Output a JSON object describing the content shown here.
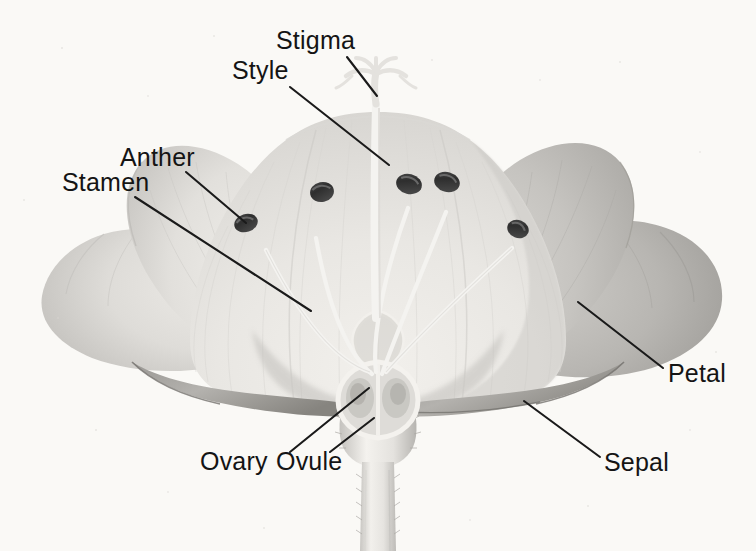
{
  "figure": {
    "background_color": "#faf9f6",
    "line_color": "#1a1a1a",
    "text_color": "#141414"
  },
  "labels": [
    {
      "id": "stigma",
      "text": "Stigma",
      "text_x": 276,
      "text_y": 49,
      "leader": {
        "x1": 347,
        "y1": 57,
        "x2": 377,
        "y2": 96
      },
      "target": "stigma-crown"
    },
    {
      "id": "style",
      "text": "Style",
      "text_x": 232,
      "text_y": 79,
      "leader": {
        "x1": 290,
        "y1": 87,
        "x2": 389,
        "y2": 165
      },
      "target": "style-column"
    },
    {
      "id": "anther",
      "text": "Anther",
      "text_x": 120,
      "text_y": 166,
      "leader": {
        "x1": 186,
        "y1": 172,
        "x2": 246,
        "y2": 223
      },
      "target": "anther-left"
    },
    {
      "id": "stamen",
      "text": "Stamen",
      "text_x": 62,
      "text_y": 191,
      "leader": {
        "x1": 135,
        "y1": 197,
        "x2": 311,
        "y2": 311
      },
      "target": "stamen-filament"
    },
    {
      "id": "petal",
      "text": "Petal",
      "text_x": 668,
      "text_y": 382,
      "leader": {
        "x1": 663,
        "y1": 368,
        "x2": 578,
        "y2": 302
      },
      "target": "petal-right"
    },
    {
      "id": "sepal",
      "text": "Sepal",
      "text_x": 604,
      "text_y": 471,
      "leader": {
        "x1": 600,
        "y1": 457,
        "x2": 524,
        "y2": 401
      },
      "target": "sepal-right"
    },
    {
      "id": "ovary",
      "text": "Ovary",
      "text_x": 200,
      "text_y": 470,
      "leader": {
        "x1": 290,
        "y1": 452,
        "x2": 369,
        "y2": 388
      },
      "target": "ovary-chamber"
    },
    {
      "id": "ovule",
      "text": "Ovule",
      "text_x": 276,
      "text_y": 470,
      "leader": {
        "x1": 330,
        "y1": 452,
        "x2": 374,
        "y2": 418
      },
      "target": "ovule-body"
    }
  ],
  "parts": {
    "petal_left_outer": "petal-left-outer",
    "petal_left": "petal-left",
    "petal_center": "petal-center",
    "petal_right": "petal-right",
    "petal_right_outer": "petal-right-outer",
    "sepal_left": "sepal-left",
    "sepal_right": "sepal-right",
    "receptacle": "receptacle",
    "stem": "stem",
    "ovary": "ovary",
    "ovules": 2,
    "style": "style",
    "stigma": "stigma",
    "anther_count": 5,
    "filament_count": 5
  },
  "palette": {
    "background": "#faf9f6",
    "petal_light": "#e8e6e2",
    "petal_mid": "#d2d0cc",
    "petal_dark": "#a8a6a2",
    "petal_shadow": "#8e8c88",
    "anther_dark": "#3a3a3a",
    "anther_highlight": "#6e6e6e",
    "filament_pale": "#f4f3f0",
    "stem_pale": "#eceae6",
    "outline": "#1a1a1a"
  }
}
